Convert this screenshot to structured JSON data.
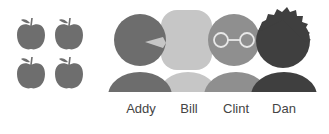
{
  "apples": {
    "count": 4,
    "color": "#6e6e6e",
    "items": [
      {
        "icon": "apple-icon"
      },
      {
        "icon": "apple-icon"
      },
      {
        "icon": "apple-icon"
      },
      {
        "icon": "apple-icon"
      }
    ]
  },
  "people": [
    {
      "name": "Addy",
      "color": "#6d6d6d",
      "feature": "beak"
    },
    {
      "name": "Bill",
      "color": "#c6c6c6",
      "feature": "rounded-square-head"
    },
    {
      "name": "Clint",
      "color": "#8f8f8f",
      "feature": "glasses"
    },
    {
      "name": "Dan",
      "color": "#3f3f3f",
      "feature": "spiky-hair"
    }
  ]
}
